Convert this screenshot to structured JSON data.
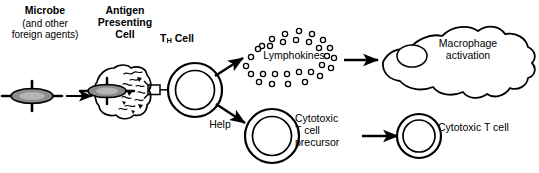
{
  "diagram": {
    "background_color": "#ffffff",
    "stroke_color": "#000000",
    "microbe_fill": "#8c8c8c",
    "labels": {
      "microbe_title": "Microbe",
      "microbe_subtitle": "(and other\nforeign agents)",
      "antigen_presenting_cell": "Antigen\nPresenting\nCell",
      "th_cell_t": "T",
      "th_cell_subscript": "H",
      "th_cell_rest": " Cell",
      "lymphokines": "Lymphokines",
      "macrophage_activation": "Macrophage\nactivation",
      "help": "Help",
      "cytotoxic_t_cell_precursor": "Cytotoxic\nT cell\nprecursor",
      "cytotoxic_t_cell": "Cytotoxic T cell"
    },
    "nodes": [
      {
        "id": "microbe",
        "name": "microbe-antigen",
        "shape": "spiked-ellipse"
      },
      {
        "id": "apc",
        "name": "antigen-presenting-cell",
        "shape": "irregular-blob"
      },
      {
        "id": "th-cell",
        "name": "t-helper-cell",
        "shape": "double-ring-circle"
      },
      {
        "id": "lymphokine-cloud",
        "name": "lymphokine-cloud",
        "shape": "small-circle-cluster",
        "circle_count": 30
      },
      {
        "id": "macrophage",
        "name": "activated-macrophage",
        "shape": "amoeboid-blob"
      },
      {
        "id": "ctl-precursor",
        "name": "cytotoxic-t-cell-precursor",
        "shape": "double-ring-circle"
      },
      {
        "id": "ctl",
        "name": "cytotoxic-t-cell",
        "shape": "double-ring-circle"
      }
    ],
    "arrows": [
      {
        "id": "a1",
        "name": "arrow-microbe-to-apc",
        "from": "microbe",
        "to": "apc",
        "label": ""
      },
      {
        "id": "a2",
        "name": "arrow-th-to-lymphokines",
        "from": "th-cell",
        "to": "lymphokine-cloud",
        "label": ""
      },
      {
        "id": "a3",
        "name": "arrow-th-to-ctl-precursor",
        "from": "th-cell",
        "to": "ctl-precursor",
        "label": "Help"
      },
      {
        "id": "a4",
        "name": "arrow-lymphokines-to-macrophage",
        "from": "lymphokine-cloud",
        "to": "macrophage",
        "label": ""
      },
      {
        "id": "a5",
        "name": "arrow-precursor-to-ctl",
        "from": "ctl-precursor",
        "to": "ctl",
        "label": ""
      }
    ]
  }
}
